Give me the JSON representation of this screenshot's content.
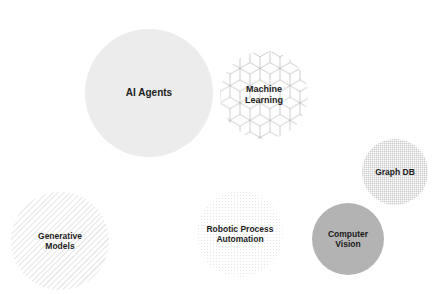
{
  "diagram": {
    "type": "bubble-cluster",
    "bubbles": [
      {
        "id": "ai-agents",
        "label": "AI Agents",
        "cx": 149,
        "cy": 93,
        "r": 64,
        "fill": "#ececec",
        "pattern": "solid"
      },
      {
        "id": "machine-learning",
        "label": "Machine\nLearning",
        "cx": 264,
        "cy": 95,
        "r": 44,
        "fill": "#ffffff",
        "pattern": "isometric-cubes"
      },
      {
        "id": "graph-db",
        "label": "Graph DB",
        "cx": 395,
        "cy": 172,
        "r": 33,
        "fill": "#ffffff",
        "pattern": "fine-grid"
      },
      {
        "id": "computer-vision",
        "label": "Computer\nVision",
        "cx": 348,
        "cy": 239,
        "r": 36,
        "fill": "#b3b3b3",
        "pattern": "solid"
      },
      {
        "id": "robotic-process-automation",
        "label": "Robotic Process\nAutomation",
        "cx": 240,
        "cy": 234,
        "r": 43,
        "fill": "#ffffff",
        "pattern": "dots"
      },
      {
        "id": "generative-models",
        "label": "Generative\nModels",
        "cx": 60,
        "cy": 241,
        "r": 49,
        "fill": "#ffffff",
        "pattern": "diagonal-stripes"
      }
    ]
  }
}
